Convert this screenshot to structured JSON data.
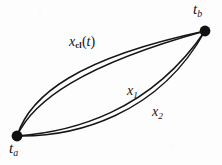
{
  "figure": {
    "kind": "path-integral-trajectory-diagram",
    "background_color": "#fdfdfd",
    "ink_color": "#161616",
    "endpoints": [
      {
        "id": "t_a",
        "label_base": "t",
        "label_sub": "a",
        "x": 17,
        "y": 136,
        "radius": 5.4,
        "color": "#111111"
      },
      {
        "id": "t_b",
        "label_base": "t",
        "label_sub": "b",
        "x": 205,
        "y": 31,
        "radius": 5.4,
        "color": "#111111"
      }
    ],
    "curves": [
      {
        "id": "xcl-upper",
        "group": "x_cl",
        "d": "M 17 136 C 30 95, 78 58, 205 31",
        "stroke_width": 1.5
      },
      {
        "id": "xcl-lower",
        "group": "x_cl",
        "d": "M 17 136 C 33 101, 82 65, 205 31",
        "stroke_width": 1.5
      },
      {
        "id": "x1",
        "group": "x_1",
        "d": "M 17 136 C 72 132, 150 112, 205 31",
        "stroke_width": 1.5
      },
      {
        "id": "x2",
        "group": "x_2",
        "d": "M 17 136 C 74 137, 158 116, 205 31",
        "stroke_width": 1.5
      }
    ],
    "labels": [
      {
        "id": "x_cl",
        "base": "x",
        "sub": "cl",
        "sub_style": "roman-bold",
        "suffix": "(t)",
        "x": 69,
        "y": 35
      },
      {
        "id": "x_1",
        "base": "x",
        "sub": "1",
        "sub_style": "italic",
        "suffix": "",
        "x": 127,
        "y": 84
      },
      {
        "id": "x_2",
        "base": "x",
        "sub": "2",
        "sub_style": "italic",
        "suffix": "",
        "x": 152,
        "y": 105
      }
    ],
    "text": {
      "t_base": "t",
      "ta_sub": "a",
      "tb_sub": "b",
      "x_base": "x",
      "xcl_sub": "cl",
      "xcl_suffix_open": "(",
      "xcl_suffix_var": "t",
      "xcl_suffix_close": ")",
      "x1_sub": "1",
      "x2_sub": "2"
    }
  }
}
